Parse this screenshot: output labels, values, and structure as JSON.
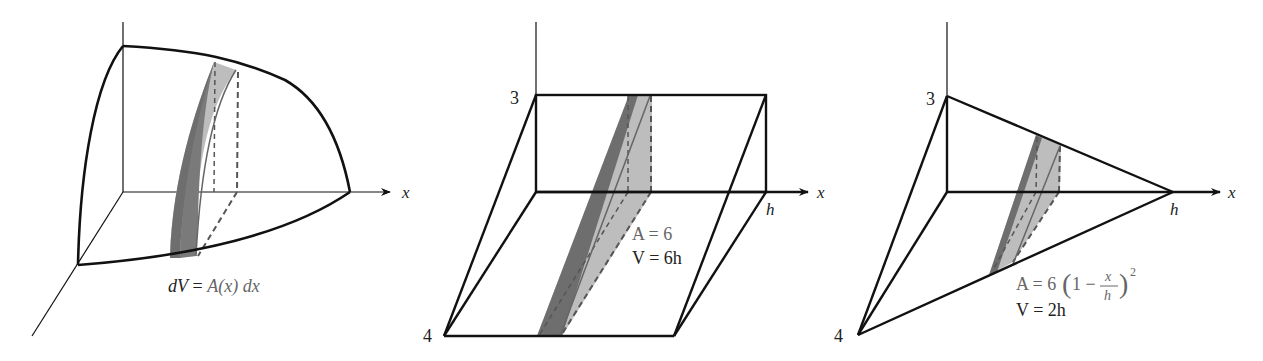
{
  "figures": [
    {
      "id": "general-solid",
      "axis_label": "x",
      "formula": "dV = A(x) dx",
      "formula_parts": {
        "lhs": "dV",
        "eq": " = ",
        "rhs": "A(x) dx"
      }
    },
    {
      "id": "prism",
      "axis_label": "x",
      "vertical_label": "3",
      "depth_label": "4",
      "length_label": "h",
      "area_formula": "A = 6",
      "volume_formula": "V = 6h"
    },
    {
      "id": "pyramid",
      "axis_label": "x",
      "vertical_label": "3",
      "depth_label": "4",
      "length_label": "h",
      "area_formula_prefix": "A = 6",
      "area_formula_paren_open": "(",
      "area_formula_one_minus": "1 −",
      "area_formula_num": "x",
      "area_formula_den": "h",
      "area_formula_paren_close": ")",
      "area_formula_exp": "2",
      "volume_formula": "V = 2h"
    }
  ],
  "colors": {
    "line": "#111111",
    "dark_slice": "#6e6e6e",
    "light_slice": "#bdbdbd",
    "dashed": "#555555"
  }
}
